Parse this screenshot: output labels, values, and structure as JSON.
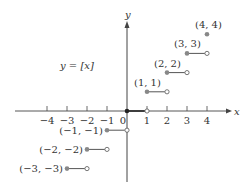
{
  "chart_data": {
    "type": "scatter",
    "title": "y = [x]",
    "function_label": "y = [x]",
    "xlabel": "x",
    "ylabel": "y",
    "x_ticks": [
      -4,
      -3,
      -2,
      -1,
      0,
      1,
      2,
      3,
      4
    ],
    "x_tick_labels": [
      "−4",
      "−3",
      "−2",
      "−1",
      "0",
      "1",
      "2",
      "3",
      "4"
    ],
    "xlim": [
      -4.5,
      5
    ],
    "ylim": [
      -3.5,
      5
    ],
    "grid": false,
    "steps": [
      {
        "x_start": -3,
        "x_end": -2,
        "y": -3,
        "label": "(−3, −3)",
        "closed_start": true,
        "open_end": true
      },
      {
        "x_start": -2,
        "x_end": -1,
        "y": -2,
        "label": "(−2, −2)",
        "closed_start": true,
        "open_end": true
      },
      {
        "x_start": -1,
        "x_end": 0,
        "y": -1,
        "label": "(−1, −1)",
        "closed_start": true,
        "open_end": true
      },
      {
        "x_start": 0,
        "x_end": 1,
        "y": 0,
        "label": "",
        "closed_start": true,
        "open_end": true
      },
      {
        "x_start": 1,
        "x_end": 2,
        "y": 1,
        "label": "(1, 1)",
        "closed_start": true,
        "open_end": true
      },
      {
        "x_start": 2,
        "x_end": 3,
        "y": 2,
        "label": "(2, 2)",
        "closed_start": true,
        "open_end": true
      },
      {
        "x_start": 3,
        "x_end": 4,
        "y": 3,
        "label": "(3, 3)",
        "closed_start": true,
        "open_end": true
      },
      {
        "x_start": 4,
        "x_end": 4,
        "y": 4,
        "label": "(4, 4)",
        "closed_start": true,
        "open_end": false
      }
    ]
  },
  "colors": {
    "axis": "#444444",
    "point": "#888888",
    "segment": "#555555",
    "text": "#333333"
  }
}
